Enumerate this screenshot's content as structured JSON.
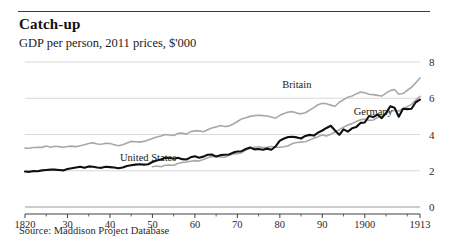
{
  "header": {
    "title": "Catch-up",
    "subtitle": "GDP per person, 2011 prices, $'000"
  },
  "footer": {
    "source": "Source: Maddison Project Database"
  },
  "chart_data": {
    "type": "line",
    "title": "Catch-up",
    "subtitle": "GDP per person, 2011 prices, $'000",
    "xlabel": "",
    "ylabel": "",
    "xlim": [
      1820,
      1913
    ],
    "ylim": [
      0,
      8
    ],
    "yticks": [
      0,
      2,
      4,
      6,
      8
    ],
    "ytick_labels": [
      "0",
      "2",
      "4",
      "6",
      "8"
    ],
    "y_axis_position": "right",
    "grid": "horizontal",
    "xticks": [
      1820,
      1830,
      1840,
      1850,
      1860,
      1870,
      1880,
      1890,
      1900,
      1913
    ],
    "xtick_labels": [
      "1820",
      "30",
      "40",
      "50",
      "60",
      "70",
      "80",
      "90",
      "1900",
      "1913"
    ],
    "legend": "inline-labels",
    "annotations": [
      {
        "text": "Britain",
        "x": 1884,
        "y": 6.55
      },
      {
        "text": "Germany",
        "x": 1902,
        "y": 5.05
      },
      {
        "text": "United States",
        "x": 1849,
        "y": 2.55
      }
    ],
    "series": [
      {
        "name": "Britain",
        "color": "#a8a8a8",
        "width": 1.6,
        "x": [
          1820,
          1821,
          1822,
          1823,
          1824,
          1825,
          1826,
          1827,
          1828,
          1829,
          1830,
          1831,
          1832,
          1833,
          1834,
          1835,
          1836,
          1837,
          1838,
          1839,
          1840,
          1841,
          1842,
          1843,
          1844,
          1845,
          1846,
          1847,
          1848,
          1849,
          1850,
          1851,
          1852,
          1853,
          1854,
          1855,
          1856,
          1857,
          1858,
          1859,
          1860,
          1861,
          1862,
          1863,
          1864,
          1865,
          1866,
          1867,
          1868,
          1869,
          1870,
          1871,
          1872,
          1873,
          1874,
          1875,
          1876,
          1877,
          1878,
          1879,
          1880,
          1881,
          1882,
          1883,
          1884,
          1885,
          1886,
          1887,
          1888,
          1889,
          1890,
          1891,
          1892,
          1893,
          1894,
          1895,
          1896,
          1897,
          1898,
          1899,
          1900,
          1901,
          1902,
          1903,
          1904,
          1905,
          1906,
          1907,
          1908,
          1909,
          1910,
          1911,
          1912,
          1913
        ],
        "y": [
          3.25,
          3.24,
          3.28,
          3.3,
          3.29,
          3.36,
          3.3,
          3.35,
          3.33,
          3.3,
          3.34,
          3.36,
          3.33,
          3.38,
          3.44,
          3.5,
          3.54,
          3.48,
          3.46,
          3.52,
          3.5,
          3.44,
          3.38,
          3.44,
          3.53,
          3.62,
          3.6,
          3.58,
          3.62,
          3.7,
          3.78,
          3.86,
          3.92,
          4.0,
          3.97,
          3.95,
          4.06,
          4.08,
          4.02,
          4.16,
          4.2,
          4.2,
          4.15,
          4.26,
          4.36,
          4.42,
          4.5,
          4.44,
          4.46,
          4.58,
          4.72,
          4.86,
          4.92,
          5.0,
          5.04,
          5.06,
          5.04,
          5.02,
          4.96,
          4.9,
          5.06,
          5.16,
          5.24,
          5.26,
          5.18,
          5.14,
          5.2,
          5.34,
          5.48,
          5.64,
          5.72,
          5.7,
          5.62,
          5.56,
          5.78,
          5.92,
          6.06,
          6.12,
          6.24,
          6.34,
          6.3,
          6.22,
          6.2,
          6.16,
          6.12,
          6.28,
          6.42,
          6.48,
          6.22,
          6.26,
          6.44,
          6.6,
          6.86,
          7.12
        ]
      },
      {
        "name": "Germany",
        "color": "#a8a8a8",
        "width": 1.6,
        "x": [
          1850,
          1851,
          1852,
          1853,
          1854,
          1855,
          1856,
          1857,
          1858,
          1859,
          1860,
          1861,
          1862,
          1863,
          1864,
          1865,
          1866,
          1867,
          1868,
          1869,
          1870,
          1871,
          1872,
          1873,
          1874,
          1875,
          1876,
          1877,
          1878,
          1879,
          1880,
          1881,
          1882,
          1883,
          1884,
          1885,
          1886,
          1887,
          1888,
          1889,
          1890,
          1891,
          1892,
          1893,
          1894,
          1895,
          1896,
          1897,
          1898,
          1899,
          1900,
          1901,
          1902,
          1903,
          1904,
          1905,
          1906,
          1907,
          1908,
          1909,
          1910,
          1911,
          1912,
          1913
        ],
        "y": [
          2.22,
          2.26,
          2.22,
          2.3,
          2.32,
          2.3,
          2.4,
          2.46,
          2.48,
          2.52,
          2.56,
          2.54,
          2.62,
          2.72,
          2.78,
          2.8,
          2.76,
          2.74,
          2.84,
          2.92,
          2.94,
          3.0,
          3.14,
          3.24,
          3.3,
          3.32,
          3.28,
          3.3,
          3.34,
          3.3,
          3.3,
          3.32,
          3.38,
          3.5,
          3.56,
          3.58,
          3.6,
          3.7,
          3.8,
          3.88,
          3.98,
          3.92,
          4.02,
          4.14,
          4.26,
          4.4,
          4.52,
          4.6,
          4.72,
          4.82,
          4.84,
          4.78,
          4.8,
          4.94,
          5.04,
          5.18,
          5.26,
          5.34,
          5.3,
          5.42,
          5.54,
          5.66,
          5.9,
          6.1
        ]
      },
      {
        "name": "United States",
        "color": "#101010",
        "width": 2.1,
        "x": [
          1820,
          1821,
          1822,
          1823,
          1824,
          1825,
          1826,
          1827,
          1828,
          1829,
          1830,
          1831,
          1832,
          1833,
          1834,
          1835,
          1836,
          1837,
          1838,
          1839,
          1840,
          1841,
          1842,
          1843,
          1844,
          1845,
          1846,
          1847,
          1848,
          1849,
          1850,
          1851,
          1852,
          1853,
          1854,
          1855,
          1856,
          1857,
          1858,
          1859,
          1860,
          1861,
          1862,
          1863,
          1864,
          1865,
          1866,
          1867,
          1868,
          1869,
          1870,
          1871,
          1872,
          1873,
          1874,
          1875,
          1876,
          1877,
          1878,
          1879,
          1880,
          1881,
          1882,
          1883,
          1884,
          1885,
          1886,
          1887,
          1888,
          1889,
          1890,
          1891,
          1892,
          1893,
          1894,
          1895,
          1896,
          1897,
          1898,
          1899,
          1900,
          1901,
          1902,
          1903,
          1904,
          1905,
          1906,
          1907,
          1908,
          1909,
          1910,
          1911,
          1912,
          1913
        ],
        "y": [
          1.96,
          1.94,
          1.98,
          1.97,
          2.02,
          2.04,
          2.06,
          2.06,
          2.04,
          2.02,
          2.1,
          2.14,
          2.18,
          2.22,
          2.16,
          2.24,
          2.22,
          2.18,
          2.16,
          2.22,
          2.2,
          2.18,
          2.14,
          2.18,
          2.26,
          2.3,
          2.34,
          2.36,
          2.34,
          2.36,
          2.48,
          2.56,
          2.62,
          2.72,
          2.7,
          2.66,
          2.72,
          2.64,
          2.62,
          2.74,
          2.8,
          2.72,
          2.78,
          2.88,
          2.9,
          2.78,
          2.86,
          2.88,
          2.9,
          3.0,
          3.06,
          3.08,
          3.2,
          3.28,
          3.18,
          3.2,
          3.16,
          3.22,
          3.16,
          3.34,
          3.66,
          3.78,
          3.86,
          3.88,
          3.84,
          3.78,
          3.92,
          3.98,
          3.94,
          4.1,
          4.22,
          4.36,
          4.48,
          4.22,
          3.98,
          4.28,
          4.16,
          4.34,
          4.42,
          4.64,
          4.66,
          5.02,
          4.96,
          5.1,
          4.9,
          5.18,
          5.56,
          5.48,
          4.98,
          5.42,
          5.4,
          5.42,
          5.78,
          5.92
        ]
      }
    ]
  }
}
